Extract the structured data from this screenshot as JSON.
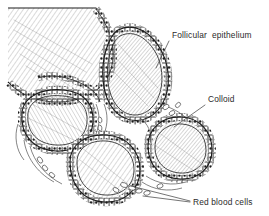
{
  "figure": {
    "kind": "histology-line-drawing",
    "background_color": "#ffffff",
    "ink_color": "#1c1c1c",
    "text_color": "#2b2b2b",
    "width": 269,
    "height": 216
  },
  "labels": [
    {
      "id": "follicular-epithelium",
      "text": "Follicular  epithelium",
      "text_x": 172,
      "text_y": 38,
      "leader": {
        "x1": 169,
        "y1": 41,
        "x2": 156,
        "y2": 68
      }
    },
    {
      "id": "colloid",
      "text": "Colloid",
      "text_x": 208,
      "text_y": 102,
      "leader": {
        "x1": 205,
        "y1": 105,
        "x2": 174,
        "y2": 127
      }
    },
    {
      "id": "red-blood-cells",
      "text": "Red blood cells",
      "text_x": 193,
      "text_y": 205,
      "leader_a": {
        "x1": 190,
        "y1": 201,
        "x2": 131,
        "y2": 186
      },
      "leader_b": {
        "x1": 190,
        "y1": 202,
        "x2": 143,
        "y2": 196
      }
    }
  ],
  "structures": {
    "follicles": [
      {
        "id": "follicle-upper-left",
        "cx": 78,
        "cy": 52,
        "rx": 52,
        "ry": 44,
        "note": "large, cut at figure edge"
      },
      {
        "id": "follicle-upper-right",
        "cx": 133,
        "cy": 75,
        "rx": 35,
        "ry": 44,
        "note": "tall ovoid"
      },
      {
        "id": "follicle-left",
        "cx": 55,
        "cy": 122,
        "rx": 37,
        "ry": 30
      },
      {
        "id": "follicle-bottom",
        "cx": 104,
        "cy": 169,
        "rx": 36,
        "ry": 33
      },
      {
        "id": "follicle-right",
        "cx": 180,
        "cy": 147,
        "rx": 33,
        "ry": 32
      }
    ],
    "epithelium_description": "single layer of cuboidal cells with dark round nuclei lining each follicle",
    "colloid_description": "homogeneous hatched material filling each follicle lumen",
    "interstitium_description": "thin connective tissue strands between follicles containing red blood cells"
  }
}
